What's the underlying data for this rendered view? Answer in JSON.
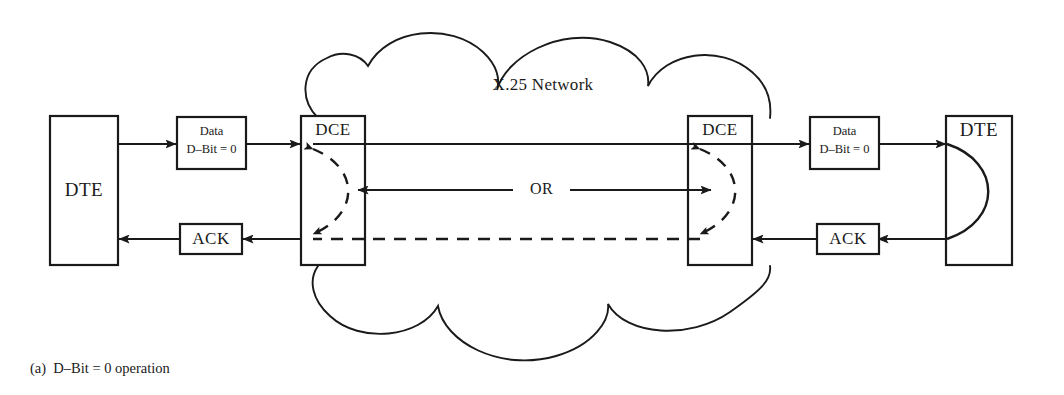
{
  "figure": {
    "caption": "(a)  D–Bit = 0 operation",
    "cloud_label": "X.25 Network",
    "or_label": "OR"
  },
  "nodes": {
    "left_dte": {
      "label": "DTE"
    },
    "left_dce": {
      "label": "DCE"
    },
    "right_dce": {
      "label": "DCE"
    },
    "right_dte": {
      "label": "DTE"
    }
  },
  "packets": {
    "left_data": {
      "line1": "Data",
      "line2": "D–Bit = 0"
    },
    "right_data": {
      "line1": "Data",
      "line2": "D–Bit = 0"
    },
    "left_ack": {
      "label": "ACK"
    },
    "right_ack": {
      "label": "ACK"
    }
  },
  "colors": {
    "stroke": "#1a1a1a",
    "background": "#ffffff"
  }
}
